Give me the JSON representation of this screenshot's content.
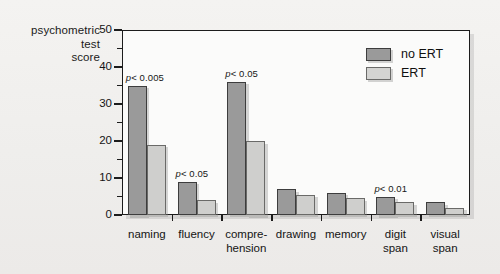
{
  "axis_title_lines": [
    "psychometric",
    "test",
    "score"
  ],
  "legend": {
    "items": [
      {
        "label": "no ERT",
        "swatch": "dark",
        "color": "#9a9a9a"
      },
      {
        "label": "ERT",
        "swatch": "light",
        "color": "#cfcfcd"
      }
    ]
  },
  "chart_data": {
    "type": "bar",
    "title": "",
    "xlabel": "",
    "ylabel": "psychometric test score",
    "ylim": [
      0,
      50
    ],
    "yticks": [
      0,
      10,
      20,
      30,
      40,
      50
    ],
    "ytick_labels": [
      "0",
      "10",
      "20",
      "30",
      "40",
      "50"
    ],
    "minor_ticks": [
      5,
      15,
      25,
      35,
      45
    ],
    "grid": false,
    "legend_position": "top-right",
    "categories": [
      "naming",
      "fluency",
      "compre-\nhension",
      "drawing",
      "memory",
      "digit\nspan",
      "visual\nspan"
    ],
    "series": [
      {
        "name": "no ERT",
        "values": [
          35,
          9,
          36,
          7,
          6,
          5,
          3.5
        ]
      },
      {
        "name": "ERT",
        "values": [
          19,
          4,
          20,
          5.5,
          4.5,
          3.5,
          2
        ]
      }
    ],
    "annotations": [
      {
        "category": "naming",
        "text": "p < 0.005"
      },
      {
        "category": "fluency",
        "text": "p < 0.05"
      },
      {
        "category": "compre-\nhension",
        "text": "p < 0.05"
      },
      {
        "category": "digit\nspan",
        "text": "p < 0.01"
      }
    ]
  }
}
